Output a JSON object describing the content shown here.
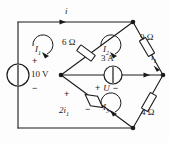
{
  "figure": {
    "kind": "electrical-circuit-schematic"
  },
  "sources": {
    "voltage_source": {
      "value": "10 V",
      "plus": "+",
      "minus": "−",
      "name": "10-volt-source"
    },
    "current_source": {
      "value": "3 A",
      "name": "3-amp-current-source"
    },
    "dependent_source": {
      "value": "2i",
      "subscript": "1",
      "plus": "+",
      "minus": "−",
      "name": "dependent-source-2i1"
    }
  },
  "resistors": [
    {
      "label": "6 Ω",
      "name": "resistor-6-ohm",
      "branch": "top-left"
    },
    {
      "label": "9 Ω",
      "name": "resistor-9-ohm",
      "branch": "top-right"
    },
    {
      "label": "4 Ω",
      "name": "resistor-4-ohm",
      "branch": "bottom-right"
    }
  ],
  "mesh_currents": [
    {
      "label": "I",
      "subscript": "1",
      "name": "mesh-current-I1"
    },
    {
      "label": "I",
      "subscript": "2",
      "name": "mesh-current-I2"
    },
    {
      "label": "I",
      "subscript": "3",
      "name": "mesh-current-I3"
    }
  ],
  "branch_currents": [
    {
      "label": "i",
      "subscript": "",
      "name": "current-i-top"
    },
    {
      "label": "i",
      "subscript": "1",
      "name": "current-i1-right"
    }
  ],
  "voltage_labels": [
    {
      "plus": "+",
      "symbol": "U",
      "minus": "−",
      "name": "voltage-U-across-current-source"
    }
  ],
  "colors": {
    "wire": "#1a1a1a",
    "background": "#fdfdfd",
    "text": "#1a1a1a"
  }
}
